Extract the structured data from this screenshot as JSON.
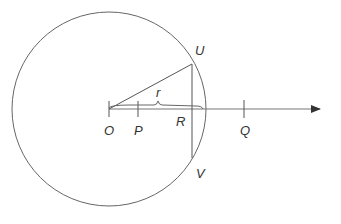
{
  "diagram": {
    "title": "",
    "colors": {
      "stroke": "#555555",
      "text": "#333333",
      "background": "#ffffff"
    },
    "circle": {
      "cx": 109,
      "cy": 109,
      "r": 97
    },
    "axis": {
      "x1": 109,
      "y1": 109,
      "x2": 320,
      "y2": 109,
      "arrow": true
    },
    "labels": {
      "O": "O",
      "P": "P",
      "R": "R",
      "Q": "Q",
      "U": "U",
      "V": "V",
      "r": "r"
    },
    "points": {
      "O": {
        "x": 109,
        "y": 109
      },
      "P": {
        "x": 138,
        "y": 109
      },
      "R": {
        "x": 192,
        "y": 109
      },
      "Q": {
        "x": 244,
        "y": 109
      },
      "U": {
        "x": 192,
        "y": 64
      },
      "V": {
        "x": 192,
        "y": 158
      }
    }
  }
}
